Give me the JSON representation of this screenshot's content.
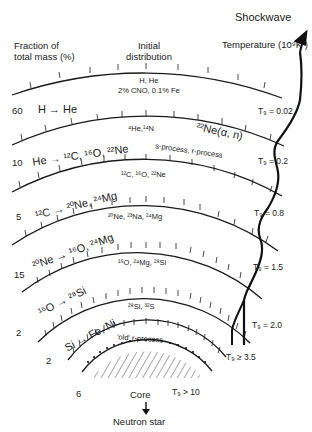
{
  "header": {
    "fraction_label": "Fraction of\ntotal mass (%)",
    "initial_label": "Initial\ndistribution",
    "shockwave": "Shockwave",
    "temperature": "Temperature (10⁹K )"
  },
  "layers": [
    {
      "fraction": "",
      "reaction": "",
      "product": "H, He\n2% CNO, 0.1% Fe",
      "temp": "T₉ = 0.02"
    },
    {
      "fraction": "60",
      "reaction": "H → He",
      "product": "⁴He,¹⁴N",
      "temp": "T₉ = 0.2"
    },
    {
      "fraction": "10",
      "reaction": "He → ¹²C, ¹⁶O, ²²Ne",
      "product": "¹²C, ¹⁶O, ²²Ne",
      "temp": "T₉ = 0.8"
    },
    {
      "fraction": "5",
      "reaction": "¹²C → ²⁰Ne, ²⁴Mg",
      "product": "²⁰Ne, ²³Na, ²⁴Mg",
      "temp": "T₉ = 1.5"
    },
    {
      "fraction": "15",
      "reaction": "²⁰Ne → ¹⁶O, ²⁴Mg",
      "product": "¹⁶O, ²⁴Mg, ²⁸Si",
      "temp": "T₉ = 2.0"
    },
    {
      "fraction": "2",
      "reaction": "¹⁶O → ²⁸Si",
      "product": "²⁸Si, ³²S",
      "temp": "T₉ ≥ 3.5"
    },
    {
      "fraction": "2",
      "reaction": "Si → Fe, Ni",
      "product": "'old' r-process",
      "temp": "T₉ > 10"
    }
  ],
  "annotations": {
    "ne22": "²²Ne(α, n)",
    "s_r_process": "s-process, r-process"
  },
  "core": {
    "fraction": "6",
    "label": "Core",
    "arrow": "↓",
    "remnant": "Neutron star"
  }
}
